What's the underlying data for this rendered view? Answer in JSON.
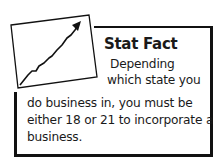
{
  "sidebar_box": {
    "icon": "trending-up-chart-icon",
    "title": "Stat Fact",
    "lines": [
      "Depending",
      "which state you",
      "do business in, you must be",
      "either 18 or 21 to incorporate a",
      "business."
    ]
  },
  "colors": {
    "border": "#111111",
    "text": "#1a1a1a",
    "background": "#ffffff"
  }
}
